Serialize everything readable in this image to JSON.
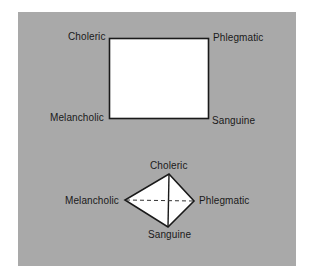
{
  "colors": {
    "panel_background": "#a9a9a9",
    "shape_fill": "#ffffff",
    "stroke": "#1a1a1a",
    "text": "#1a1a1a"
  },
  "top_diagram": {
    "shape": "rectangle",
    "labels": {
      "top_left": "Choleric",
      "top_right": "Phlegmatic",
      "bottom_left": "Melancholic",
      "bottom_right": "Sanguine"
    }
  },
  "bottom_diagram": {
    "shape": "tetrahedron",
    "labels": {
      "top": "Choleric",
      "left": "Melancholic",
      "right": "Phlegmatic",
      "bottom": "Sanguine"
    },
    "hidden_edge": "Melancholic-Phlegmatic (dashed)"
  }
}
